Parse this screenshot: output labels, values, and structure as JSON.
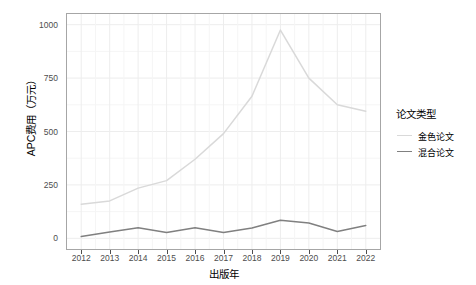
{
  "chart_data": {
    "type": "line",
    "title": "",
    "xlabel": "出版年",
    "ylabel": "APC费用（万元）",
    "categories": [
      2012,
      2013,
      2014,
      2015,
      2016,
      2017,
      2018,
      2019,
      2020,
      2021,
      2022
    ],
    "x_tick_labels": [
      "2012",
      "2013",
      "2014",
      "2015",
      "2016",
      "2017",
      "2018",
      "2019",
      "2020",
      "2021",
      "2022"
    ],
    "y_tick_labels": [
      "0",
      "250",
      "500",
      "750",
      "1000"
    ],
    "y_ticks": [
      0,
      250,
      500,
      750,
      1000
    ],
    "ylim": [
      0,
      1000
    ],
    "xlim": [
      2012,
      2022
    ],
    "grid": true,
    "legend_position": "right",
    "series": [
      {
        "name": "金色论文",
        "color": "#d9d9d9",
        "values": [
          160,
          175,
          235,
          270,
          370,
          490,
          665,
          975,
          750,
          625,
          595
        ]
      },
      {
        "name": "混合论文",
        "color": "#808080",
        "values": [
          8,
          30,
          50,
          27,
          50,
          27,
          48,
          85,
          72,
          32,
          60
        ]
      }
    ]
  },
  "legend": {
    "title": "论文类型",
    "items": [
      {
        "label": "金色论文",
        "color": "#d9d9d9"
      },
      {
        "label": "混合论文",
        "color": "#808080"
      }
    ]
  },
  "axes": {
    "x_title": "出版年",
    "y_title": "APC费用（万元）"
  },
  "colors": {
    "panel_border": "#a6a6a6",
    "grid_major": "#ededed",
    "grid_minor": "#f5f5f5",
    "tick_text": "#4d4d4d",
    "axis_text": "#000000",
    "background": "#ffffff"
  }
}
